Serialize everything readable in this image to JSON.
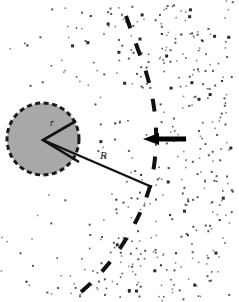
{
  "figure": {
    "width": 239,
    "height": 302,
    "background_color": "#ffffff"
  },
  "labels": {
    "inner_radius": "r",
    "stand_off_radius": "R"
  },
  "obstacle": {
    "name": "grain",
    "shape": "circle",
    "center_x": 43,
    "center_y": 139,
    "radius": 36,
    "fill_color": "#a8a8a8",
    "edge_color": "#1a1a1a",
    "edge_style": "dashed",
    "edge_dash": "5 3.5",
    "edge_width": 3,
    "wedge": {
      "name": "radius-wedge",
      "vertex_x": 43,
      "vertex_y": 140,
      "arm1_x": 76,
      "arm1_y": 121,
      "arm2_x": 79,
      "arm2_y": 162,
      "stroke_color": "#111111",
      "stroke_width": 2.6
    }
  },
  "radius_line": {
    "name": "stand-off-radius-line",
    "x1": 43,
    "y1": 140,
    "x2": 152,
    "y2": 187,
    "stroke_color": "#111111",
    "stroke_width": 2.4
  },
  "shock_front": {
    "name": "shock-front",
    "style": "dashed-arc",
    "stroke_color": "#111111",
    "stroke_width": 4,
    "dash": "13 16",
    "points": [
      [
        126,
        16
      ],
      [
        136,
        44
      ],
      [
        146,
        72
      ],
      [
        153,
        101
      ],
      [
        156,
        130
      ],
      [
        155,
        158
      ],
      [
        150,
        186
      ],
      [
        140,
        213
      ],
      [
        126,
        239
      ],
      [
        110,
        262
      ],
      [
        92,
        282
      ],
      [
        74,
        298
      ]
    ]
  },
  "flow_arrow": {
    "name": "flow-arrow",
    "direction": "left",
    "tip_x": 143,
    "tail_x": 186,
    "y": 139,
    "shaft_thickness": 5,
    "head_length": 16,
    "head_height": 12,
    "color": "#000000"
  },
  "particles": {
    "name": "particle-field",
    "color_dark": "#2b2b2b",
    "color_mid": "#555555",
    "color_light": "#888888",
    "count": 430,
    "note": "dense downstream of shock, sparse in shadow behind grain"
  },
  "colors": {
    "ink": "#111111",
    "grain_fill": "#a8a8a8",
    "paper": "#ffffff"
  }
}
